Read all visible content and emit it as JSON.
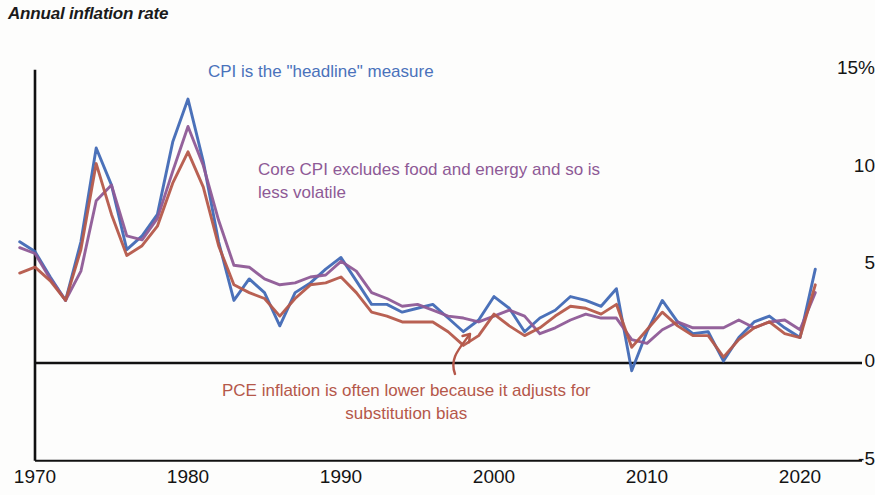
{
  "chart_data": {
    "type": "line",
    "title": "Annual inflation rate",
    "xlabel": "",
    "ylabel": "",
    "ylim": [
      -5,
      15
    ],
    "xlim": [
      1969,
      1922
    ],
    "grid": false,
    "legend_position": "inline-annotations",
    "ytick_labels": [
      "15%",
      "10",
      "5",
      "0",
      "-5"
    ],
    "ytick_values": [
      15,
      10,
      5,
      0,
      -5
    ],
    "xtick_labels": [
      "1970",
      "1980",
      "1990",
      "2000",
      "2010",
      "2020"
    ],
    "xtick_values": [
      1970,
      1980,
      1990,
      2000,
      2010,
      2020
    ],
    "x": [
      1969,
      1970,
      1971,
      1972,
      1973,
      1974,
      1975,
      1976,
      1977,
      1978,
      1979,
      1980,
      1981,
      1982,
      1983,
      1984,
      1985,
      1986,
      1987,
      1988,
      1989,
      1990,
      1991,
      1992,
      1993,
      1994,
      1995,
      1996,
      1997,
      1998,
      1999,
      2000,
      2001,
      2002,
      2003,
      2004,
      2005,
      2006,
      2007,
      2008,
      2009,
      2010,
      2011,
      2012,
      2013,
      2014,
      2015,
      2016,
      2017,
      2018,
      2019,
      2020,
      2021
    ],
    "series": [
      {
        "name": "CPI",
        "color": "#4169b5",
        "values": [
          6.2,
          5.7,
          4.4,
          3.2,
          6.2,
          11.0,
          9.1,
          5.8,
          6.5,
          7.6,
          11.3,
          13.5,
          10.3,
          6.2,
          3.2,
          4.3,
          3.6,
          1.9,
          3.6,
          4.1,
          4.8,
          5.4,
          4.2,
          3.0,
          3.0,
          2.6,
          2.8,
          3.0,
          2.3,
          1.6,
          2.2,
          3.4,
          2.8,
          1.6,
          2.3,
          2.7,
          3.4,
          3.2,
          2.9,
          3.8,
          -0.4,
          1.6,
          3.2,
          2.1,
          1.5,
          1.6,
          0.1,
          1.3,
          2.1,
          2.4,
          1.8,
          1.3,
          4.8
        ]
      },
      {
        "name": "Core CPI",
        "color": "#8e5a96",
        "values": [
          5.9,
          5.6,
          4.3,
          3.2,
          4.7,
          8.3,
          9.1,
          6.5,
          6.3,
          7.4,
          9.8,
          12.1,
          10.1,
          7.3,
          5.0,
          4.9,
          4.3,
          4.0,
          4.1,
          4.4,
          4.5,
          5.2,
          4.7,
          3.6,
          3.3,
          2.9,
          3.0,
          2.7,
          2.4,
          2.3,
          2.1,
          2.4,
          2.7,
          2.4,
          1.5,
          1.8,
          2.2,
          2.5,
          2.3,
          2.3,
          1.2,
          1.0,
          1.7,
          2.1,
          1.8,
          1.8,
          1.8,
          2.2,
          1.8,
          2.1,
          2.2,
          1.7,
          3.6
        ]
      },
      {
        "name": "PCE",
        "color": "#b5584a",
        "values": [
          4.6,
          4.9,
          4.2,
          3.2,
          5.8,
          10.2,
          7.6,
          5.5,
          6.0,
          7.0,
          9.2,
          10.8,
          9.0,
          6.0,
          4.0,
          3.6,
          3.3,
          2.4,
          3.3,
          4.0,
          4.1,
          4.4,
          3.6,
          2.6,
          2.4,
          2.1,
          2.1,
          2.1,
          1.6,
          0.9,
          1.4,
          2.5,
          1.9,
          1.4,
          1.8,
          2.4,
          2.9,
          2.8,
          2.5,
          3.0,
          0.8,
          1.7,
          2.6,
          1.9,
          1.4,
          1.4,
          0.3,
          1.2,
          1.8,
          2.1,
          1.5,
          1.3,
          4.0
        ]
      }
    ],
    "annotations": [
      {
        "id": "cpi",
        "text": "CPI is the \"headline\" measure",
        "color": "#4a72bb",
        "x_px": 208,
        "y_px": 60
      },
      {
        "id": "core",
        "text": "Core CPI excludes food and energy and so is\nless volatile",
        "color": "#8e5a96",
        "x_px": 258,
        "y_px": 158
      },
      {
        "id": "pce",
        "text": "PCE inflation is often lower because it adjusts for\nsubstitution bias",
        "color": "#b5584a",
        "x_px": 222,
        "y_px": 379
      }
    ],
    "pointer_arrow": {
      "color": "#b5584a",
      "from_px": [
        455,
        374
      ],
      "to_px": [
        470,
        334
      ]
    }
  }
}
